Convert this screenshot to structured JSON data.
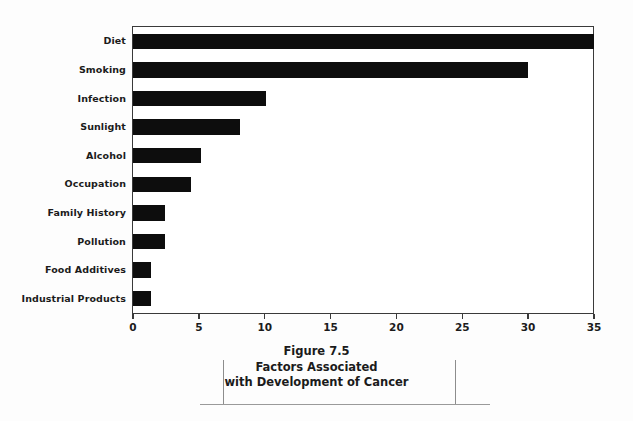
{
  "chart_data": {
    "type": "bar",
    "orientation": "horizontal",
    "title": "",
    "xlabel": "",
    "ylabel": "",
    "xlim": [
      0,
      35
    ],
    "ylim": null,
    "grid": false,
    "legend": null,
    "bar_color": "#0d0d0d",
    "frame_color": "#3a3a3a",
    "xticks": [
      0,
      5,
      10,
      15,
      20,
      25,
      30,
      35
    ],
    "xticklabels": [
      "0",
      "5",
      "10",
      "15",
      "20",
      "25",
      "30",
      "35"
    ],
    "categories": [
      "Diet",
      "Smoking",
      "Infection",
      "Sunlight",
      "Alcohol",
      "Occupation",
      "Family History",
      "Pollution",
      "Food Additives",
      "Industrial Products"
    ],
    "values": [
      35,
      30,
      10.1,
      8.1,
      5.2,
      4.4,
      2.4,
      2.4,
      1.4,
      1.4
    ]
  },
  "caption": {
    "figure_number": "Figure 7.5",
    "line_1": "Factors Associated",
    "line_2": "with Development of Cancer"
  }
}
